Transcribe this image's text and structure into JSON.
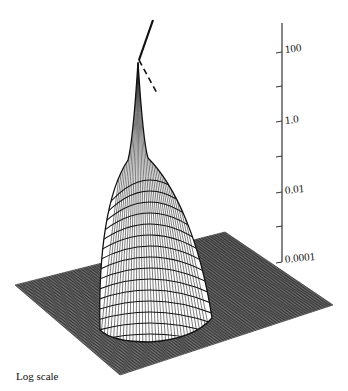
{
  "chart_data": {
    "type": "surface3d",
    "title": "",
    "caption": "Log scale",
    "zaxis": {
      "scale": "log",
      "tick_labels": [
        "100",
        "1.0",
        "0.01",
        "0.0001"
      ],
      "tick_values": [
        100,
        1.0,
        0.01,
        0.0001
      ],
      "minor_ticks_between": 1,
      "range": [
        0.0001,
        1000
      ]
    },
    "surface": {
      "description": "Flat square mesh grid base plane with a central dome rising to a sharp spike at the center",
      "grid_lines": 40,
      "peak_value_approx": 300,
      "base_value": 0.0001,
      "peak_indicator": "broken line pointing to the spike apex, continuing off the top of the plot"
    },
    "grid": false,
    "legend": null
  },
  "axis": {
    "labels": [
      "100",
      "1.0",
      "0.01",
      "0.0001"
    ]
  },
  "caption": "Log scale"
}
